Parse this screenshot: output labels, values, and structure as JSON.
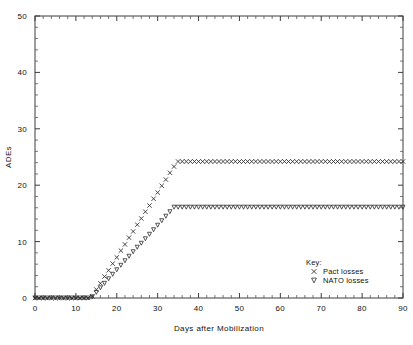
{
  "chart_data": {
    "type": "scatter",
    "title": "",
    "xlabel": "Days after Mobilization",
    "ylabel": "ADEs",
    "xlim": [
      0,
      90
    ],
    "ylim": [
      0,
      50
    ],
    "xticks": [
      0,
      10,
      20,
      30,
      40,
      50,
      60,
      70,
      80,
      90
    ],
    "yticks": [
      0,
      10,
      20,
      30,
      40,
      50
    ],
    "xtick_labels": [
      "0",
      "10",
      "20",
      "30",
      "40",
      "50",
      "60",
      "70",
      "80",
      "90"
    ],
    "ytick_labels": [
      "0",
      "10",
      "20",
      "30",
      "40",
      "50"
    ],
    "grid": false,
    "legend_position": "bottom-right",
    "legend_title": "Key:",
    "series": [
      {
        "name": "Pact losses",
        "marker": "x",
        "x": [
          0,
          1,
          2,
          3,
          4,
          5,
          6,
          7,
          8,
          9,
          10,
          11,
          12,
          13,
          14,
          15,
          16,
          17,
          18,
          19,
          20,
          21,
          22,
          23,
          24,
          25,
          26,
          27,
          28,
          29,
          30,
          31,
          32,
          33,
          34,
          35,
          36,
          37,
          38,
          39,
          40,
          41,
          42,
          43,
          44,
          45,
          46,
          47,
          48,
          49,
          50,
          51,
          52,
          53,
          54,
          55,
          56,
          57,
          58,
          59,
          60,
          61,
          62,
          63,
          64,
          65,
          66,
          67,
          68,
          69,
          70,
          71,
          72,
          73,
          74,
          75,
          76,
          77,
          78,
          79,
          80,
          81,
          82,
          83,
          84,
          85,
          86,
          87,
          88,
          89,
          90
        ],
        "y": [
          0,
          0,
          0,
          0,
          0,
          0,
          0,
          0,
          0,
          0,
          0,
          0,
          0,
          0,
          0.3,
          1.5,
          2.6,
          3.8,
          4.9,
          6.1,
          7.2,
          8.4,
          9.5,
          10.7,
          11.8,
          13.0,
          14.1,
          15.3,
          16.4,
          17.6,
          18.7,
          19.9,
          21.0,
          22.2,
          23.3,
          24.2,
          24.2,
          24.2,
          24.2,
          24.2,
          24.2,
          24.2,
          24.2,
          24.2,
          24.2,
          24.2,
          24.2,
          24.2,
          24.2,
          24.2,
          24.2,
          24.2,
          24.2,
          24.2,
          24.2,
          24.2,
          24.2,
          24.2,
          24.2,
          24.2,
          24.2,
          24.2,
          24.2,
          24.2,
          24.2,
          24.2,
          24.2,
          24.2,
          24.2,
          24.2,
          24.2,
          24.2,
          24.2,
          24.2,
          24.2,
          24.2,
          24.2,
          24.2,
          24.2,
          24.2,
          24.2,
          24.2,
          24.2,
          24.2,
          24.2,
          24.2,
          24.2,
          24.2,
          24.2,
          24.2,
          24.2
        ]
      },
      {
        "name": "NATO losses",
        "marker": "triangle-down",
        "x": [
          0,
          1,
          2,
          3,
          4,
          5,
          6,
          7,
          8,
          9,
          10,
          11,
          12,
          13,
          14,
          15,
          16,
          17,
          18,
          19,
          20,
          21,
          22,
          23,
          24,
          25,
          26,
          27,
          28,
          29,
          30,
          31,
          32,
          33,
          34,
          35,
          36,
          37,
          38,
          39,
          40,
          41,
          42,
          43,
          44,
          45,
          46,
          47,
          48,
          49,
          50,
          51,
          52,
          53,
          54,
          55,
          56,
          57,
          58,
          59,
          60,
          61,
          62,
          63,
          64,
          65,
          66,
          67,
          68,
          69,
          70,
          71,
          72,
          73,
          74,
          75,
          76,
          77,
          78,
          79,
          80,
          81,
          82,
          83,
          84,
          85,
          86,
          87,
          88,
          89,
          90
        ],
        "y": [
          0,
          0,
          0,
          0,
          0,
          0,
          0,
          0,
          0,
          0,
          0,
          0,
          0,
          0,
          0.2,
          1.0,
          1.8,
          2.6,
          3.4,
          4.2,
          5.0,
          5.8,
          6.6,
          7.4,
          8.2,
          9.0,
          9.7,
          10.5,
          11.3,
          12.1,
          12.9,
          13.7,
          14.5,
          15.3,
          16.1,
          16.1,
          16.1,
          16.1,
          16.1,
          16.1,
          16.1,
          16.1,
          16.1,
          16.1,
          16.1,
          16.1,
          16.1,
          16.1,
          16.1,
          16.1,
          16.1,
          16.1,
          16.1,
          16.1,
          16.1,
          16.1,
          16.1,
          16.1,
          16.1,
          16.1,
          16.1,
          16.1,
          16.1,
          16.1,
          16.1,
          16.1,
          16.1,
          16.1,
          16.1,
          16.1,
          16.1,
          16.1,
          16.1,
          16.1,
          16.1,
          16.1,
          16.1,
          16.1,
          16.1,
          16.1,
          16.1,
          16.1,
          16.1,
          16.1,
          16.1,
          16.1,
          16.1,
          16.1,
          16.1,
          16.1,
          16.1
        ]
      }
    ]
  },
  "axes": {
    "y_title": "ADEs",
    "x_title": "Days after Mobilization"
  },
  "legend": {
    "title": "Key:",
    "entries": [
      {
        "symbol": "×",
        "label": "Pact losses"
      },
      {
        "symbol": "∇",
        "label": "NATO losses"
      }
    ]
  },
  "colors": {
    "axis": "#3c3c3c",
    "marker": "#2b2b2b",
    "background": "#ffffff"
  }
}
